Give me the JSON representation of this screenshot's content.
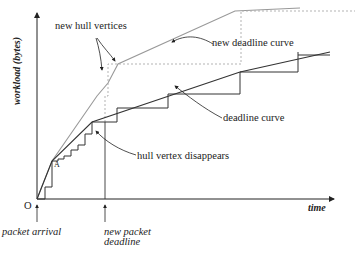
{
  "diagram": {
    "type": "workload vs time deadline curve diagram",
    "axes": {
      "x_label": "time",
      "y_label": "workload (bytes)",
      "origin_label": "O"
    },
    "annotations": {
      "new_hull_vertices": "new hull vertices",
      "new_deadline_curve": "new deadline curve",
      "deadline_curve": "deadline curve",
      "hull_vertex_disappears": "hull vertex disappears",
      "point_a": "A"
    },
    "bottom_markers": {
      "packet_arrival": "packet arrival",
      "new_packet_deadline_line1": "new packet",
      "new_packet_deadline_line2": "deadline"
    },
    "colors": {
      "axis": "#222222",
      "deadline_curve": "#333333",
      "new_deadline_curve": "#999999",
      "dashed": "#aaaaaa",
      "text": "#222222"
    }
  }
}
